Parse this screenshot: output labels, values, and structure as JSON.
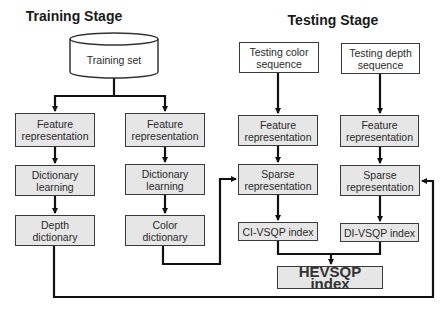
{
  "training": {
    "title": "Training Stage",
    "training_set": "Training set",
    "left": {
      "feature": "Feature\nrepresentation",
      "dict_learning": "Dictionary\nlearning",
      "dictionary": "Depth\ndictionary"
    },
    "right": {
      "feature": "Feature\nrepresentation",
      "dict_learning": "Dictionary\nlearning",
      "dictionary": "Color\ndictionary"
    }
  },
  "testing": {
    "title": "Testing Stage",
    "color": {
      "sequence": "Testing color\nsequence",
      "feature": "Feature\nrepresentation",
      "sparse": "Sparse\nrepresentation",
      "index": "CI-VSQP index"
    },
    "depth": {
      "sequence": "Testing depth\nsequence",
      "feature": "Feature\nrepresentation",
      "sparse": "Sparse\nrepresentation",
      "index": "DI-VSQP index"
    },
    "final_index": "HEVSQP index"
  },
  "colors": {
    "box_fill": "#e6e6e6",
    "box_border": "#3a3a3a",
    "line": "#111111"
  }
}
